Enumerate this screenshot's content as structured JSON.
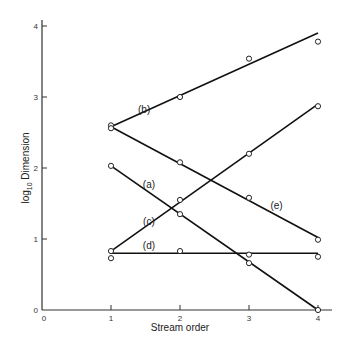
{
  "chart_data": {
    "type": "line",
    "title": "",
    "xlabel": "Stream order",
    "ylabel": "log10 Dimension",
    "ylabel_main": "log",
    "ylabel_sub": "10",
    "ylabel_rest": " Dimension",
    "xlim": [
      0,
      4
    ],
    "ylim": [
      0,
      4
    ],
    "x_ticks": [
      0,
      1,
      2,
      3,
      4
    ],
    "y_ticks": [
      0,
      1,
      2,
      3,
      4
    ],
    "grid": false,
    "legend": "none (series labelled inline)",
    "series": [
      {
        "name": "(a)",
        "x": [
          1,
          2,
          3,
          4
        ],
        "points": [
          2.03,
          1.35,
          0.66,
          0.0
        ],
        "fit": [
          [
            1,
            2.03
          ],
          [
            4,
            0.0
          ]
        ],
        "label_pos": [
          1.55,
          1.72
        ]
      },
      {
        "name": "(b)",
        "x": [
          1,
          2,
          3,
          4
        ],
        "points": [
          2.6,
          3.0,
          3.54,
          3.78
        ],
        "fit": [
          [
            1,
            2.58
          ],
          [
            4,
            3.9
          ]
        ],
        "label_pos": [
          1.48,
          2.78
        ]
      },
      {
        "name": "(c)",
        "x": [
          1,
          2,
          3,
          4
        ],
        "points": [
          0.83,
          1.55,
          2.2,
          2.87
        ],
        "fit": [
          [
            1,
            0.83
          ],
          [
            4,
            2.9
          ]
        ],
        "label_pos": [
          1.55,
          1.2
        ]
      },
      {
        "name": "(d)",
        "x": [
          1,
          2,
          3,
          4
        ],
        "points": [
          0.73,
          0.83,
          0.78,
          0.75
        ],
        "fit": [
          [
            1,
            0.8
          ],
          [
            4,
            0.8
          ]
        ],
        "label_pos": [
          1.55,
          0.86
        ]
      },
      {
        "name": "(e)",
        "x": [
          1,
          2,
          3,
          4
        ],
        "points": [
          2.56,
          2.08,
          1.58,
          0.99
        ],
        "fit": [
          [
            1,
            2.58
          ],
          [
            4,
            1.02
          ]
        ],
        "label_pos": [
          3.4,
          1.42
        ]
      }
    ]
  }
}
